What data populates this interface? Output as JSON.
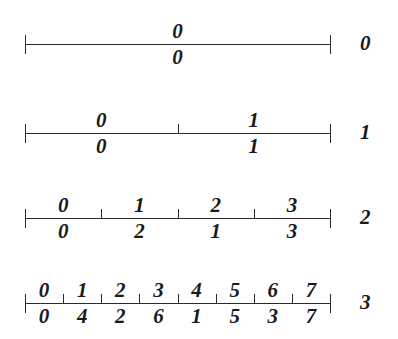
{
  "figure": {
    "background_color": "#ffffff",
    "ink_color": "#2b2b2b",
    "axis": {
      "x_start": 25,
      "x_end": 330
    },
    "row_label_x": 360,
    "rows": [
      {
        "name": "row-0",
        "label": "0",
        "line_y": 44,
        "segments": 1,
        "top": [
          "0"
        ],
        "bottom": [
          "0"
        ]
      },
      {
        "name": "row-1",
        "label": "1",
        "line_y": 133,
        "segments": 2,
        "top": [
          "0",
          "1"
        ],
        "bottom": [
          "0",
          "1"
        ]
      },
      {
        "name": "row-2",
        "label": "2",
        "line_y": 218,
        "segments": 4,
        "top": [
          "0",
          "1",
          "2",
          "3"
        ],
        "bottom": [
          "0",
          "2",
          "1",
          "3"
        ]
      },
      {
        "name": "row-3",
        "label": "3",
        "line_y": 303,
        "segments": 8,
        "top": [
          "0",
          "1",
          "2",
          "3",
          "4",
          "5",
          "6",
          "7"
        ],
        "bottom": [
          "0",
          "4",
          "2",
          "6",
          "1",
          "5",
          "3",
          "7"
        ]
      }
    ]
  }
}
